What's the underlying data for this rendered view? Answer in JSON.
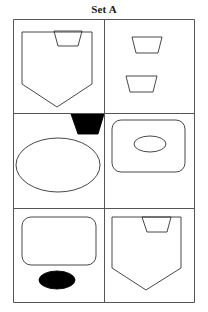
{
  "title": "Set A",
  "figure": {
    "caption": "Set A",
    "grid": {
      "rows": 3,
      "cols": 2,
      "border_color": "#555555",
      "background": "#ffffff"
    },
    "cells": [
      {
        "id": "cell-r1c1",
        "row": 1,
        "col": 1,
        "name": "cell-top-left",
        "description": "Large outlined pentagon (shield pointing down) containing a small outlined trapezoid near the top right",
        "shapes": [
          {
            "name": "pentagon-shield-outline",
            "kind": "pentagon",
            "fill": "none",
            "stroke": "#333333",
            "filled": false,
            "size": "large"
          },
          {
            "name": "trapezoid-outline",
            "kind": "trapezoid",
            "fill": "none",
            "stroke": "#333333",
            "filled": false,
            "size": "small",
            "position": "inside-top-right"
          }
        ]
      },
      {
        "id": "cell-r1c2",
        "row": 1,
        "col": 2,
        "name": "cell-top-right",
        "description": "Two small outlined trapezoids stacked vertically",
        "shapes": [
          {
            "name": "trapezoid-outline-upper",
            "kind": "trapezoid",
            "fill": "none",
            "stroke": "#333333",
            "filled": false,
            "size": "small",
            "position": "upper-center"
          },
          {
            "name": "trapezoid-outline-lower",
            "kind": "trapezoid",
            "fill": "none",
            "stroke": "#333333",
            "filled": false,
            "size": "small",
            "position": "lower-center"
          }
        ]
      },
      {
        "id": "cell-r2c1",
        "row": 2,
        "col": 1,
        "name": "cell-middle-left",
        "description": "Large outlined ellipse with a solid black trapezoid overlapping its top right",
        "shapes": [
          {
            "name": "ellipse-outline",
            "kind": "ellipse",
            "fill": "none",
            "stroke": "#333333",
            "filled": false,
            "size": "large"
          },
          {
            "name": "trapezoid-filled",
            "kind": "trapezoid",
            "fill": "#000000",
            "stroke": "#000000",
            "filled": true,
            "size": "small",
            "position": "top-right-overlap"
          }
        ]
      },
      {
        "id": "cell-r2c2",
        "row": 2,
        "col": 2,
        "name": "cell-middle-right",
        "description": "Large outlined rounded rectangle containing a small outlined ellipse",
        "shapes": [
          {
            "name": "rounded-rectangle-outline",
            "kind": "rounded-rectangle",
            "fill": "none",
            "stroke": "#333333",
            "filled": false,
            "size": "large"
          },
          {
            "name": "ellipse-outline-small",
            "kind": "ellipse",
            "fill": "none",
            "stroke": "#333333",
            "filled": false,
            "size": "small",
            "position": "inside-center"
          }
        ]
      },
      {
        "id": "cell-r3c1",
        "row": 3,
        "col": 1,
        "name": "cell-bottom-left",
        "description": "Large outlined rounded rectangle with a solid black ellipse below it",
        "shapes": [
          {
            "name": "rounded-rectangle-outline",
            "kind": "rounded-rectangle",
            "fill": "none",
            "stroke": "#333333",
            "filled": false,
            "size": "large"
          },
          {
            "name": "ellipse-filled",
            "kind": "ellipse",
            "fill": "#000000",
            "stroke": "#000000",
            "filled": true,
            "size": "small",
            "position": "below-center"
          }
        ]
      },
      {
        "id": "cell-r3c2",
        "row": 3,
        "col": 2,
        "name": "cell-bottom-right",
        "description": "Large outlined pentagon (shield pointing down) containing a small outlined trapezoid near the top right",
        "shapes": [
          {
            "name": "pentagon-shield-outline",
            "kind": "pentagon",
            "fill": "none",
            "stroke": "#333333",
            "filled": false,
            "size": "large"
          },
          {
            "name": "trapezoid-outline",
            "kind": "trapezoid",
            "fill": "none",
            "stroke": "#333333",
            "filled": false,
            "size": "small",
            "position": "inside-top-right"
          }
        ]
      }
    ]
  }
}
